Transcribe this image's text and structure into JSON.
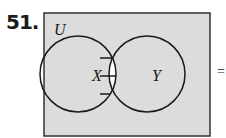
{
  "problem": {
    "number": "51.",
    "equals_sign": "=",
    "diagram": {
      "type": "venn",
      "universe_label": "U",
      "sets": [
        {
          "label": "X"
        },
        {
          "label": "Y"
        }
      ],
      "highlighted_region": "X ∩ Y",
      "colors": {
        "universe_fill": "#dcdcdc",
        "highlight_fill": "#ffffff",
        "stroke": "#1a1a1a"
      }
    }
  }
}
